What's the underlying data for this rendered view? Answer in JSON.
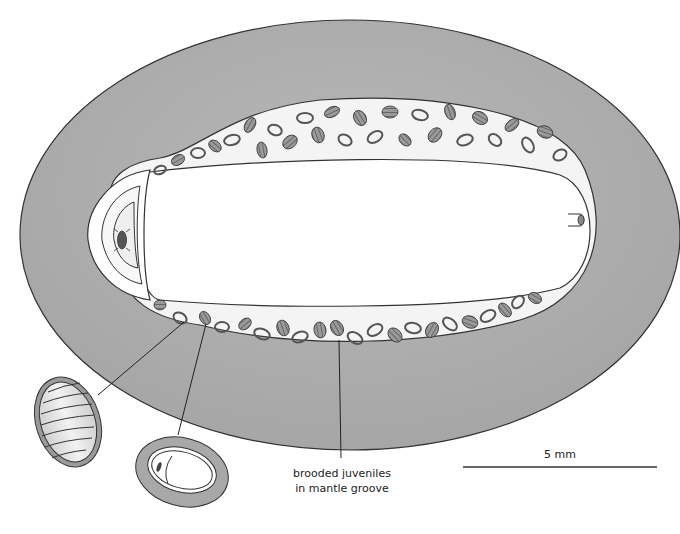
{
  "figure": {
    "type": "anatomical diagram",
    "colors": {
      "mantle": "#aeaeae",
      "outline": "#333333",
      "groove": "#f4f4f4",
      "foot": "#ffffff",
      "juvenile_fill": "#8a8a8a",
      "background": "#ffffff"
    }
  },
  "labels": {
    "brooded_juveniles_line1": "brooded juveniles",
    "brooded_juveniles_line2": "in mantle groove",
    "scale_bar": "5 mm"
  },
  "insets": [
    {
      "name": "segmented-juvenile-enlarged",
      "description": "enlarged striped oval juvenile"
    },
    {
      "name": "egg-capsule-enlarged",
      "description": "enlarged capsule with embryo"
    }
  ]
}
